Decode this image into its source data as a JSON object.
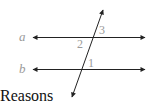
{
  "diagram": {
    "type": "parallel-lines-transversal",
    "lines": [
      {
        "name": "a",
        "label": "a"
      },
      {
        "name": "b",
        "label": "b"
      }
    ],
    "angles": [
      {
        "label": "3",
        "position": "above line a, right of transversal"
      },
      {
        "label": "2",
        "position": "below line a, left of transversal"
      },
      {
        "label": "1",
        "position": "above line b, right of transversal"
      }
    ],
    "line_color": "#222222",
    "label_color": "#9a9a9a"
  },
  "footer": {
    "text": "Reasons"
  }
}
